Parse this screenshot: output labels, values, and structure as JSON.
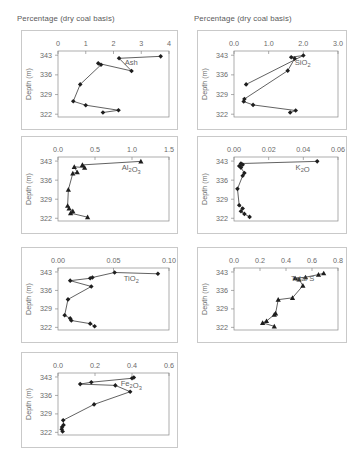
{
  "headers": {
    "left": "Percentage (dry coal basis)",
    "right": "Percentage (dry coal basis)"
  },
  "axis": {
    "depth_title": "Depth (m)",
    "depth_ticks": [
      "322",
      "329",
      "336",
      "343"
    ]
  },
  "caption": "",
  "chart_data": [
    {
      "id": "ash",
      "type": "line",
      "title": "Ash",
      "xlabel": "Percentage (dry coal basis)",
      "ylabel": "Depth (m)",
      "xlim": [
        0,
        4
      ],
      "ylim": [
        344.5,
        321.0
      ],
      "xticks": [
        0,
        1,
        2,
        3,
        4
      ],
      "xticklabels": [
        "0",
        "1",
        "2",
        "3",
        "4"
      ],
      "yticks": [
        322,
        329,
        336,
        343
      ],
      "yticklabels": [
        "322",
        "329",
        "336",
        "343"
      ],
      "marker": "diamond",
      "grid": false,
      "x": [
        1.62,
        2.18,
        1.0,
        0.55,
        0.8,
        1.55,
        1.45,
        2.65,
        2.2,
        3.7
      ],
      "y": [
        322.6,
        323.4,
        325.2,
        326.6,
        332.6,
        339.6,
        340.1,
        337.4,
        341.9,
        342.6
      ]
    },
    {
      "id": "sio2",
      "type": "line",
      "title": "SiO2",
      "title_html": "SiO<sub>2</sub>",
      "xlabel": "Percentage (dry coal basis)",
      "ylabel": "Depth (m)",
      "xlim": [
        0,
        3.0
      ],
      "ylim": [
        344.5,
        321.0
      ],
      "xticks": [
        0,
        1.0,
        2.0,
        3.0
      ],
      "xticklabels": [
        "0.0",
        "1.0",
        "2.0",
        "3.0"
      ],
      "yticks": [
        322,
        329,
        336,
        343
      ],
      "yticklabels": [
        "322",
        "329",
        "336",
        "343"
      ],
      "marker": "diamond",
      "grid": false,
      "x": [
        1.62,
        1.78,
        0.55,
        0.28,
        0.3,
        1.55,
        1.75,
        1.65,
        2.0,
        0.35
      ],
      "y": [
        322.6,
        323.3,
        325.3,
        326.5,
        327.4,
        337.5,
        341.8,
        342.3,
        342.9,
        332.6
      ]
    },
    {
      "id": "al2o3",
      "type": "line",
      "title": "Al2O3",
      "title_html": "Al<sub>2</sub>O<sub>3</sub>",
      "xlabel": "Percentage (dry coal basis)",
      "ylabel": "Depth (m)",
      "xlim": [
        0,
        1.5
      ],
      "ylim": [
        344.5,
        321.0
      ],
      "xticks": [
        0,
        0.5,
        1.0,
        1.5
      ],
      "xticklabels": [
        "0.0",
        "0.5",
        "1.0",
        "1.5"
      ],
      "yticks": [
        322,
        329,
        336,
        343
      ],
      "yticklabels": [
        "322",
        "329",
        "336",
        "343"
      ],
      "marker": "triangle",
      "grid": false,
      "x": [
        0.4,
        0.17,
        0.2,
        0.15,
        0.13,
        0.14,
        0.2,
        0.26,
        0.22,
        0.36,
        0.33,
        1.12
      ],
      "y": [
        322.4,
        323.9,
        324.6,
        325.6,
        326.6,
        332.5,
        338.5,
        338.9,
        340.9,
        340.6,
        341.6,
        342.9
      ]
    },
    {
      "id": "k2o",
      "type": "line",
      "title": "K2O",
      "title_html": "K<sub>2</sub>O",
      "xlabel": "Percentage (dry coal basis)",
      "ylabel": "Depth (m)",
      "xlim": [
        0,
        0.06
      ],
      "ylim": [
        344.5,
        321.0
      ],
      "xticks": [
        0,
        0.02,
        0.04,
        0.06
      ],
      "xticklabels": [
        "0.00",
        "0.02",
        "0.04",
        "0.06"
      ],
      "yticks": [
        322,
        329,
        336,
        343
      ],
      "yticklabels": [
        "322",
        "329",
        "336",
        "343"
      ],
      "marker": "diamond",
      "grid": false,
      "x": [
        0.009,
        0.006,
        0.004,
        0.005,
        0.003,
        0.002,
        0.005,
        0.006,
        0.004,
        0.003,
        0.005,
        0.004,
        0.048
      ],
      "y": [
        322.5,
        323.6,
        324.6,
        325.6,
        326.8,
        332.8,
        337.6,
        338.6,
        340.6,
        341.2,
        341.7,
        342.1,
        342.9
      ]
    },
    {
      "id": "tio2",
      "type": "line",
      "title": "TiO2",
      "title_html": "TiO<sub>2</sub>",
      "xlabel": "Percentage (dry coal basis)",
      "ylabel": "Depth (m)",
      "xlim": [
        0,
        0.1
      ],
      "ylim": [
        344.5,
        321.0
      ],
      "xticks": [
        0,
        0.05,
        0.1
      ],
      "xticklabels": [
        "0.00",
        "0.05",
        "0.10"
      ],
      "yticks": [
        322,
        329,
        336,
        343
      ],
      "yticklabels": [
        "322",
        "329",
        "336",
        "343"
      ],
      "marker": "diamond",
      "grid": false,
      "x": [
        0.033,
        0.029,
        0.012,
        0.011,
        0.006,
        0.009,
        0.03,
        0.011,
        0.029,
        0.031,
        0.051,
        0.09
      ],
      "y": [
        322.4,
        323.4,
        324.6,
        325.4,
        326.6,
        332.6,
        337.5,
        339.7,
        340.6,
        340.9,
        342.8,
        342.3
      ]
    },
    {
      "id": "total-s",
      "type": "line",
      "title": "Total S",
      "title_html": "Total S",
      "xlabel": "Percentage (dry coal basis)",
      "ylabel": "Depth (m)",
      "xlim": [
        0,
        0.8
      ],
      "ylim": [
        344.5,
        321.0
      ],
      "xticks": [
        0,
        0.2,
        0.4,
        0.6,
        0.8
      ],
      "xticklabels": [
        "0.0",
        "0.2",
        "0.4",
        "0.6",
        "0.8"
      ],
      "yticks": [
        322,
        329,
        336,
        343
      ],
      "yticklabels": [
        "322",
        "329",
        "336",
        "343"
      ],
      "marker": "triangle",
      "grid": false,
      "x": [
        0.31,
        0.22,
        0.25,
        0.31,
        0.32,
        0.34,
        0.45,
        0.53,
        0.5,
        0.47,
        0.55,
        0.65,
        0.69
      ],
      "y": [
        322.4,
        323.7,
        324.4,
        326.8,
        327.3,
        332.5,
        333.2,
        337.8,
        340.2,
        340.6,
        341.0,
        342.0,
        342.5
      ]
    },
    {
      "id": "fe2o3",
      "type": "line",
      "title": "Fe2O3",
      "title_html": "Fe<sub>2</sub>O<sub>3</sub>",
      "xlabel": "Percentage (dry coal basis)",
      "ylabel": "Depth (m)",
      "xlim": [
        0,
        0.6
      ],
      "ylim": [
        344.5,
        321.0
      ],
      "xticks": [
        0,
        0.2,
        0.4,
        0.6
      ],
      "xticklabels": [
        "0.0",
        "0.2",
        "0.4",
        "0.6"
      ],
      "yticks": [
        322,
        329,
        336,
        343
      ],
      "yticklabels": [
        "322",
        "329",
        "336",
        "343"
      ],
      "marker": "diamond",
      "grid": false,
      "x": [
        0.025,
        0.02,
        0.022,
        0.03,
        0.028,
        0.195,
        0.39,
        0.31,
        0.12,
        0.18,
        0.4,
        0.41
      ],
      "y": [
        322.3,
        323.2,
        324.0,
        324.8,
        326.6,
        332.6,
        337.4,
        339.8,
        340.3,
        341.0,
        342.5,
        342.8
      ]
    }
  ]
}
